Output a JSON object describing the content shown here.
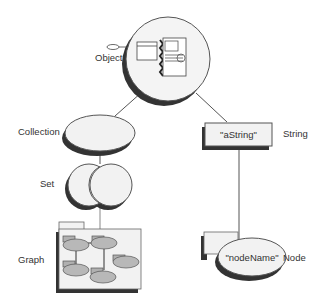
{
  "diagram": {
    "nodes": [
      {
        "id": "object",
        "label": "Object",
        "shape": "circle-with-windows"
      },
      {
        "id": "collection",
        "label": "Collection",
        "shape": "ellipse"
      },
      {
        "id": "set",
        "label": "Set",
        "shape": "overlapping-circles"
      },
      {
        "id": "graph",
        "label": "Graph",
        "shape": "folder-with-nodes"
      },
      {
        "id": "string",
        "label": "String",
        "shape": "rectangle",
        "content": "\"aString\""
      },
      {
        "id": "node",
        "label": "Node",
        "shape": "folder-ellipse",
        "content": "\"nodeName\""
      }
    ],
    "edges": [
      {
        "from": "object",
        "to": "collection"
      },
      {
        "from": "object",
        "to": "string"
      },
      {
        "from": "collection",
        "to": "set"
      },
      {
        "from": "set",
        "to": "graph"
      },
      {
        "from": "string",
        "to": "node"
      }
    ],
    "colors": {
      "line": "#555555",
      "shadow": "#333333",
      "fill_light": "#f2f2f2",
      "fill_node": "#b8b8b8",
      "text": "#333333"
    }
  }
}
